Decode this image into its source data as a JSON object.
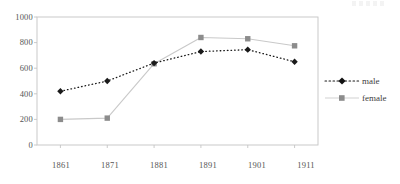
{
  "chart_data": {
    "type": "line",
    "title": "",
    "xlabel": "",
    "ylabel": "",
    "categories": [
      "1861",
      "1871",
      "1881",
      "1891",
      "1901",
      "1911"
    ],
    "x": [
      1861,
      1871,
      1881,
      1891,
      1901,
      1911
    ],
    "series": [
      {
        "name": "male",
        "values": [
          420,
          500,
          640,
          730,
          745,
          650
        ],
        "color": "#1a1a1a",
        "line_style": "dotted",
        "marker": "diamond"
      },
      {
        "name": "female",
        "values": [
          200,
          210,
          635,
          840,
          830,
          775
        ],
        "color": "#c9c9c9",
        "marker_color": "#8c8c8c",
        "line_style": "solid",
        "marker": "square"
      }
    ],
    "ylim": [
      0,
      1000
    ],
    "yticks": [
      0,
      200,
      400,
      600,
      800,
      1000
    ],
    "ytick_labels": [
      "0",
      "200",
      "400",
      "600",
      "800",
      "1000"
    ],
    "xlim": [
      1856,
      1916
    ],
    "grid": false,
    "legend_position": "right"
  },
  "legend": {
    "items": [
      {
        "label": "male"
      },
      {
        "label": "female"
      }
    ]
  },
  "axes": {
    "y_labels": [
      "1000",
      "800",
      "600",
      "400",
      "200",
      "0"
    ],
    "x_labels": [
      "1861",
      "1871",
      "1881",
      "1891",
      "1901",
      "1911"
    ]
  },
  "colors": {
    "male": "#1a1a1a",
    "female_line": "#c9c9c9",
    "female_marker": "#8c8c8c",
    "axis": "#c4c4c4",
    "text": "#555555"
  }
}
